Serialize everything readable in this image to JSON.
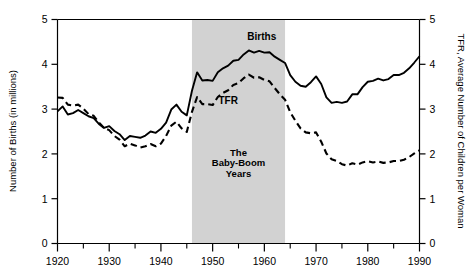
{
  "chart_data": {
    "type": "line",
    "title": "",
    "xlabel": "",
    "ylabel": "Number of Births (in millions)",
    "y2label": "TFR, Average Number of Children per Woman",
    "xlim": [
      1920,
      1990
    ],
    "ylim": [
      0,
      5
    ],
    "y2lim": [
      0,
      5
    ],
    "grid": false,
    "legend": "inline-annotations",
    "xticks": [
      1920,
      1930,
      1940,
      1950,
      1960,
      1970,
      1980,
      1990
    ],
    "xticklabels": [
      "1920",
      "1930",
      "1940",
      "1950",
      "1960",
      "1970",
      "1980",
      "1990"
    ],
    "xminorticks": [
      1925,
      1935,
      1945,
      1955,
      1965,
      1975,
      1985
    ],
    "yticks": [
      0,
      1,
      2,
      3,
      4,
      5
    ],
    "yticklabels": [
      "0",
      "1",
      "2",
      "3",
      "4",
      "5"
    ],
    "y2ticks": [
      0,
      1,
      2,
      3,
      4,
      5
    ],
    "y2ticklabels": [
      "0",
      "1",
      "2",
      "3",
      "4",
      "5"
    ],
    "annotations": [
      {
        "name": "births-label",
        "text": "Births",
        "x": 1959.5,
        "y": 4.55
      },
      {
        "name": "tfr-label",
        "text": "TFR",
        "x": 1953.0,
        "y": 3.12
      },
      {
        "name": "band-label-line1",
        "text": "The",
        "x": 1955,
        "y": 1.95
      },
      {
        "name": "band-label-line2",
        "text": "Baby-Boom",
        "x": 1955,
        "y": 1.72
      },
      {
        "name": "band-label-line3",
        "text": "Years",
        "x": 1955,
        "y": 1.49
      }
    ],
    "shaded_region": {
      "name": "baby-boom-band",
      "x_start": 1946,
      "x_end": 1964,
      "color": "#cccccc",
      "label": "The Baby-Boom Years"
    },
    "series": [
      {
        "name": "Births",
        "style": "solid",
        "color": "#000000",
        "axis": "left",
        "x": [
          1920,
          1921,
          1922,
          1923,
          1924,
          1925,
          1926,
          1927,
          1928,
          1929,
          1930,
          1931,
          1932,
          1933,
          1934,
          1935,
          1936,
          1937,
          1938,
          1939,
          1940,
          1941,
          1942,
          1943,
          1944,
          1945,
          1946,
          1947,
          1948,
          1949,
          1950,
          1951,
          1952,
          1953,
          1954,
          1955,
          1956,
          1957,
          1958,
          1959,
          1960,
          1961,
          1962,
          1963,
          1964,
          1965,
          1966,
          1967,
          1968,
          1969,
          1970,
          1971,
          1972,
          1973,
          1974,
          1975,
          1976,
          1977,
          1978,
          1979,
          1980,
          1981,
          1982,
          1983,
          1984,
          1985,
          1986,
          1987,
          1988,
          1989,
          1990
        ],
        "values": [
          2.95,
          3.06,
          2.88,
          2.91,
          2.98,
          2.91,
          2.84,
          2.8,
          2.67,
          2.58,
          2.62,
          2.51,
          2.44,
          2.31,
          2.4,
          2.38,
          2.36,
          2.41,
          2.5,
          2.47,
          2.56,
          2.7,
          2.99,
          3.1,
          2.94,
          2.86,
          3.41,
          3.82,
          3.64,
          3.65,
          3.63,
          3.82,
          3.91,
          3.97,
          4.08,
          4.1,
          4.22,
          4.31,
          4.26,
          4.3,
          4.26,
          4.27,
          4.17,
          4.1,
          4.03,
          3.76,
          3.61,
          3.52,
          3.5,
          3.6,
          3.73,
          3.56,
          3.26,
          3.14,
          3.16,
          3.14,
          3.17,
          3.33,
          3.33,
          3.49,
          3.61,
          3.63,
          3.68,
          3.64,
          3.67,
          3.76,
          3.76,
          3.81,
          3.91,
          4.04,
          4.18
        ],
        "ylabel": "Number of Births (in millions)",
        "units": "millions"
      },
      {
        "name": "TFR",
        "style": "dashed",
        "color": "#000000",
        "axis": "right",
        "x": [
          1920,
          1921,
          1922,
          1923,
          1924,
          1925,
          1926,
          1927,
          1928,
          1929,
          1930,
          1931,
          1932,
          1933,
          1934,
          1935,
          1936,
          1937,
          1938,
          1939,
          1940,
          1941,
          1942,
          1943,
          1944,
          1945,
          1946,
          1947,
          1948,
          1949,
          1950,
          1951,
          1952,
          1953,
          1954,
          1955,
          1956,
          1957,
          1958,
          1959,
          1960,
          1961,
          1962,
          1963,
          1964,
          1965,
          1966,
          1967,
          1968,
          1969,
          1970,
          1971,
          1972,
          1973,
          1974,
          1975,
          1976,
          1977,
          1978,
          1979,
          1980,
          1981,
          1982,
          1983,
          1984,
          1985,
          1986,
          1987,
          1988,
          1989,
          1990
        ],
        "values": [
          3.26,
          3.25,
          3.1,
          3.08,
          3.1,
          3.01,
          2.89,
          2.85,
          2.7,
          2.58,
          2.53,
          2.4,
          2.32,
          2.17,
          2.23,
          2.19,
          2.14,
          2.17,
          2.22,
          2.17,
          2.23,
          2.4,
          2.63,
          2.72,
          2.57,
          2.49,
          2.94,
          3.27,
          3.11,
          3.11,
          3.09,
          3.27,
          3.36,
          3.42,
          3.54,
          3.58,
          3.69,
          3.77,
          3.7,
          3.71,
          3.65,
          3.62,
          3.47,
          3.33,
          3.21,
          2.93,
          2.74,
          2.57,
          2.48,
          2.46,
          2.48,
          2.27,
          2.01,
          1.88,
          1.84,
          1.77,
          1.74,
          1.79,
          1.76,
          1.81,
          1.84,
          1.81,
          1.83,
          1.8,
          1.81,
          1.84,
          1.84,
          1.87,
          1.93,
          2.01,
          2.08
        ],
        "ylabel": "TFR, Average Number of Children per Woman",
        "units": "children per woman"
      }
    ]
  },
  "axes": {
    "left_title": "Number of Births (in millions)",
    "right_title": "TFR, Average Number of Children per Woman"
  }
}
